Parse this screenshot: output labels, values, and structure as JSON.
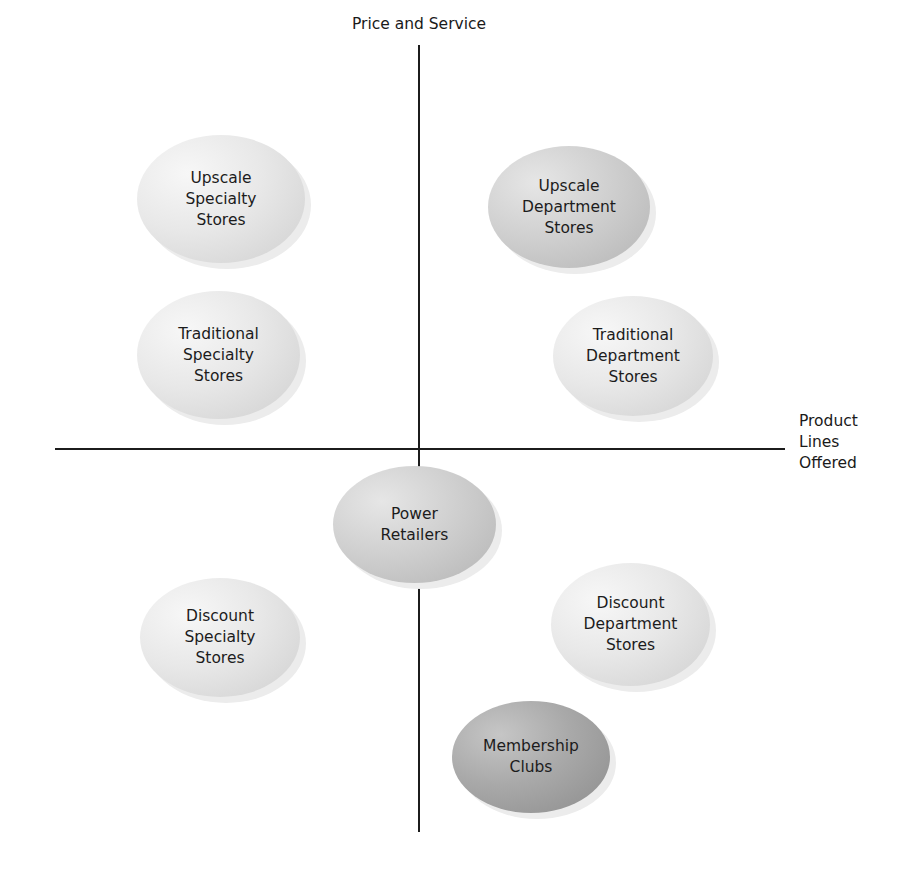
{
  "diagram": {
    "type": "positioning-map",
    "y_axis_label": "Price and Service",
    "x_axis_label_lines": [
      "Product",
      "Lines",
      "Offered"
    ],
    "colors": {
      "axis": "#1c1c1c",
      "bubble_light": "#e8e8e8",
      "bubble_mid": "#d0d0d0",
      "bubble_dark": "#a9a9a9",
      "text": "#1c1c1c"
    },
    "bubbles": [
      {
        "id": "upscale-specialty",
        "lines": [
          "Upscale",
          "Specialty",
          "Stores"
        ],
        "quadrant": "top-left",
        "tone": "light"
      },
      {
        "id": "upscale-department",
        "lines": [
          "Upscale",
          "Department",
          "Stores"
        ],
        "quadrant": "top-right",
        "tone": "mid"
      },
      {
        "id": "traditional-specialty",
        "lines": [
          "Traditional",
          "Specialty",
          "Stores"
        ],
        "quadrant": "top-left",
        "tone": "light"
      },
      {
        "id": "traditional-department",
        "lines": [
          "Traditional",
          "Department",
          "Stores"
        ],
        "quadrant": "top-right",
        "tone": "light"
      },
      {
        "id": "power-retailers",
        "lines": [
          "Power",
          "Retailers"
        ],
        "quadrant": "center",
        "tone": "mid"
      },
      {
        "id": "discount-specialty",
        "lines": [
          "Discount",
          "Specialty",
          "Stores"
        ],
        "quadrant": "bottom-left",
        "tone": "light"
      },
      {
        "id": "discount-department",
        "lines": [
          "Discount",
          "Department",
          "Stores"
        ],
        "quadrant": "bottom-right",
        "tone": "light"
      },
      {
        "id": "membership-clubs",
        "lines": [
          "Membership",
          "Clubs"
        ],
        "quadrant": "bottom-right",
        "tone": "dark"
      }
    ]
  }
}
